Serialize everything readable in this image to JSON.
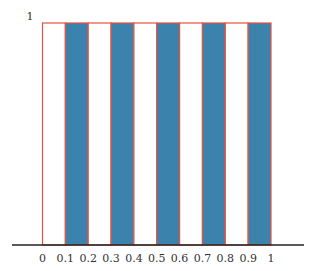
{
  "chart_data": {
    "type": "bar",
    "title": "",
    "xlabel": "",
    "ylabel": "",
    "x_ticks": [
      "0",
      "0.1",
      "0.2",
      "0.3",
      "0.4",
      "0.5",
      "0.6",
      "0.7",
      "0.8",
      "0.9",
      "1"
    ],
    "y_ticks": [
      "1"
    ],
    "ylim": [
      0,
      1
    ],
    "xlim": [
      0,
      1
    ],
    "grid": false,
    "bars": [
      {
        "x0": 0.0,
        "x1": 0.1,
        "height": 1,
        "fill": "white"
      },
      {
        "x0": 0.1,
        "x1": 0.2,
        "height": 1,
        "fill": "blue"
      },
      {
        "x0": 0.2,
        "x1": 0.3,
        "height": 1,
        "fill": "white"
      },
      {
        "x0": 0.3,
        "x1": 0.4,
        "height": 1,
        "fill": "blue"
      },
      {
        "x0": 0.4,
        "x1": 0.5,
        "height": 1,
        "fill": "white"
      },
      {
        "x0": 0.5,
        "x1": 0.6,
        "height": 1,
        "fill": "blue"
      },
      {
        "x0": 0.6,
        "x1": 0.7,
        "height": 1,
        "fill": "white"
      },
      {
        "x0": 0.7,
        "x1": 0.8,
        "height": 1,
        "fill": "blue"
      },
      {
        "x0": 0.8,
        "x1": 0.9,
        "height": 1,
        "fill": "white"
      },
      {
        "x0": 0.9,
        "x1": 1.0,
        "height": 1,
        "fill": "blue"
      }
    ],
    "colors": {
      "filled": "#3b83ac",
      "outline": "#e5533f",
      "axis": "#222222"
    }
  }
}
